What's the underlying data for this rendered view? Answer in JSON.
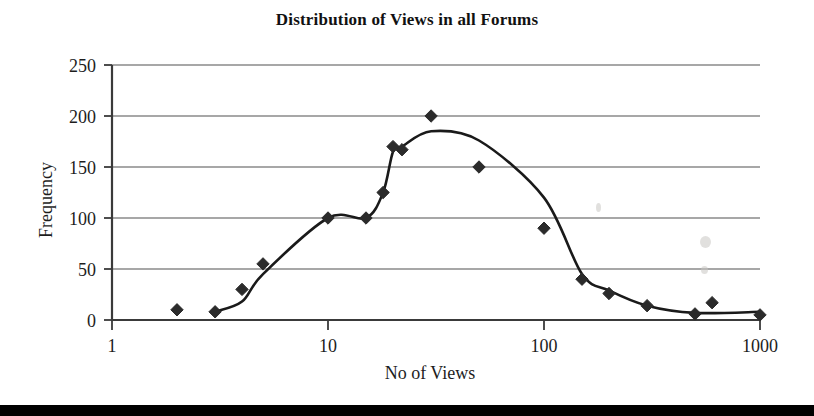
{
  "figure": {
    "title": "Distribution of Views in all Forums",
    "background_color": "#ffffff",
    "bottom_band_color": "#000000"
  },
  "axes": {
    "x_axis_label": "No of Views",
    "y_axis_label": "Frequency",
    "x_tick_labels": [
      "1",
      "10",
      "100",
      "1000"
    ],
    "y_tick_labels": [
      "0",
      "50",
      "100",
      "150",
      "200",
      "250"
    ],
    "gridline_color": "#8a8a8a",
    "axis_line_color": "#3a3a3a"
  },
  "chart_data": {
    "type": "scatter",
    "title": "Distribution of Views in all Forums",
    "xlabel": "No of Views",
    "ylabel": "Frequency",
    "xscale": "log",
    "xlim": [
      1,
      1000
    ],
    "ylim": [
      0,
      250
    ],
    "xticks": [
      1,
      10,
      100,
      1000
    ],
    "yticks": [
      0,
      50,
      100,
      150,
      200,
      250
    ],
    "grid": "horizontal",
    "legend": "none",
    "marker": "diamond",
    "marker_color": "#2b2b2b",
    "line_color": "#1a1a1a",
    "series": [
      {
        "name": "Observed frequency",
        "marker_only": true,
        "points": [
          {
            "x": 2,
            "y": 10
          },
          {
            "x": 3,
            "y": 8
          },
          {
            "x": 4,
            "y": 30
          },
          {
            "x": 5,
            "y": 55
          },
          {
            "x": 10,
            "y": 100
          },
          {
            "x": 15,
            "y": 100
          },
          {
            "x": 18,
            "y": 125
          },
          {
            "x": 20,
            "y": 170
          },
          {
            "x": 22,
            "y": 167
          },
          {
            "x": 30,
            "y": 200
          },
          {
            "x": 50,
            "y": 150
          },
          {
            "x": 100,
            "y": 90
          },
          {
            "x": 150,
            "y": 40
          },
          {
            "x": 200,
            "y": 26
          },
          {
            "x": 300,
            "y": 14
          },
          {
            "x": 500,
            "y": 6
          },
          {
            "x": 600,
            "y": 17
          },
          {
            "x": 1000,
            "y": 5
          }
        ]
      },
      {
        "name": "Fitted trend line",
        "line_only": true,
        "points": [
          {
            "x": 3,
            "y": 8
          },
          {
            "x": 4,
            "y": 18
          },
          {
            "x": 5,
            "y": 45
          },
          {
            "x": 10,
            "y": 100
          },
          {
            "x": 15,
            "y": 100
          },
          {
            "x": 18,
            "y": 125
          },
          {
            "x": 20,
            "y": 165
          },
          {
            "x": 22,
            "y": 170
          },
          {
            "x": 30,
            "y": 185
          },
          {
            "x": 50,
            "y": 176
          },
          {
            "x": 100,
            "y": 120
          },
          {
            "x": 150,
            "y": 45
          },
          {
            "x": 200,
            "y": 29
          },
          {
            "x": 300,
            "y": 14
          },
          {
            "x": 500,
            "y": 7
          },
          {
            "x": 1000,
            "y": 8
          }
        ]
      }
    ]
  }
}
